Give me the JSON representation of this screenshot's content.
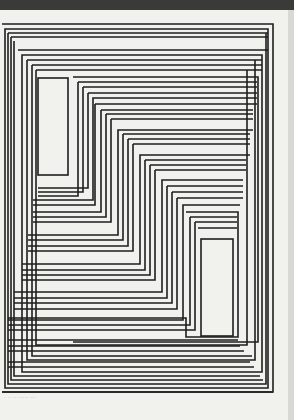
{
  "artwork": {
    "type": "op-art line print",
    "description": "Nested offset rectangular line frames with two small empty rectangles",
    "line_color": "#1e1e1e",
    "paper_color": "#f1f1ee",
    "background_color": "#3a3a38",
    "caption": "· ·· ·· ····· ···"
  }
}
